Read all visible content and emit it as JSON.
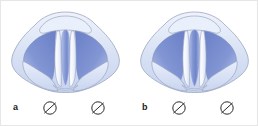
{
  "figure": {
    "background_color": "#ffffff",
    "frame_border_color": "#e6e6e6"
  },
  "colors": {
    "mucosa_light": "#dbe4f5",
    "mucosa_mid": "#c3d0ec",
    "glottis_dark_blue": "#7b8fd0",
    "glottis_deep_blue": "#6a7fc6",
    "vocal_cord_white": "#f2f5fc",
    "outline": "#8e9ab4",
    "label_text": "#1a1a1a",
    "symbol_stroke": "#2b2b2b"
  },
  "panels": [
    {
      "id": "a",
      "letter": "a",
      "symbols": [
        {
          "name": "null-symbol-left",
          "glyph": "Ø"
        },
        {
          "name": "null-symbol-right",
          "glyph": "Ø"
        }
      ]
    },
    {
      "id": "b",
      "letter": "b",
      "symbols": [
        {
          "name": "null-symbol-left",
          "glyph": "Ø"
        },
        {
          "name": "null-symbol-right",
          "glyph": "Ø"
        }
      ]
    }
  ]
}
